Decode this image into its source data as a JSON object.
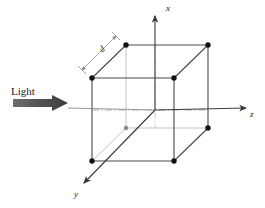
{
  "figure": {
    "background_color": "#ffffff",
    "width": 265,
    "height": 208
  },
  "axes": {
    "origin": {
      "x": 155,
      "y": 110
    },
    "x_axis": {
      "label": "x",
      "direction": "up",
      "tip": {
        "x": 155,
        "y": 14
      },
      "tail": {
        "x": 155,
        "y": 110
      },
      "color": "#3a3a3a"
    },
    "y_axis": {
      "label": "y",
      "direction": "down-left",
      "tip": {
        "x": 81,
        "y": 186
      },
      "tail": {
        "x": 155,
        "y": 110
      },
      "color": "#3a3a3a"
    },
    "z_axis": {
      "label": "z",
      "direction": "right",
      "tip": {
        "x": 249,
        "y": 108
      },
      "tail": {
        "x": 155,
        "y": 110
      },
      "color": "#3a3a3a"
    }
  },
  "light": {
    "label": "Light",
    "arrow_color": "#555555",
    "arrow_start": {
      "x": 13,
      "y": 103
    },
    "arrow_end": {
      "x": 68,
      "y": 103
    },
    "direction": "rightward along z"
  },
  "dimension": {
    "label": "d",
    "description": "edge length dimension line parallel to top-left cube edge",
    "start": {
      "x": 80,
      "y": 68
    },
    "end": {
      "x": 117,
      "y": 34
    },
    "color": "#7a7a7a"
  },
  "cube": {
    "edge_color_visible": "#4a4a4a",
    "edge_color_hidden": "#b0b0b0",
    "vertex_color": "#111111",
    "vertex_radius": 2.6,
    "vertices": [
      {
        "name": "front-top-left",
        "x": 92,
        "y": 78
      },
      {
        "name": "front-top-right",
        "x": 174,
        "y": 78
      },
      {
        "name": "front-bot-left",
        "x": 92,
        "y": 161
      },
      {
        "name": "front-bot-right",
        "x": 174,
        "y": 161
      },
      {
        "name": "back-top-left",
        "x": 126,
        "y": 45
      },
      {
        "name": "back-top-right",
        "x": 208,
        "y": 45
      },
      {
        "name": "back-bot-left",
        "x": 126,
        "y": 128
      },
      {
        "name": "back-bot-right",
        "x": 208,
        "y": 128
      }
    ],
    "edges": [
      {
        "from": "front-top-left",
        "to": "front-top-right",
        "hidden": false
      },
      {
        "from": "front-top-right",
        "to": "front-bot-right",
        "hidden": false
      },
      {
        "from": "front-bot-right",
        "to": "front-bot-left",
        "hidden": false
      },
      {
        "from": "front-bot-left",
        "to": "front-top-left",
        "hidden": false
      },
      {
        "from": "back-top-left",
        "to": "back-top-right",
        "hidden": false
      },
      {
        "from": "back-top-right",
        "to": "back-bot-right",
        "hidden": false
      },
      {
        "from": "back-bot-right",
        "to": "back-bot-left",
        "hidden": true
      },
      {
        "from": "back-bot-left",
        "to": "back-top-left",
        "hidden": true
      },
      {
        "from": "front-top-left",
        "to": "back-top-left",
        "hidden": false
      },
      {
        "from": "front-top-right",
        "to": "back-top-right",
        "hidden": false
      },
      {
        "from": "front-bot-right",
        "to": "back-bot-right",
        "hidden": false
      },
      {
        "from": "front-bot-left",
        "to": "back-bot-left",
        "hidden": true
      }
    ]
  }
}
